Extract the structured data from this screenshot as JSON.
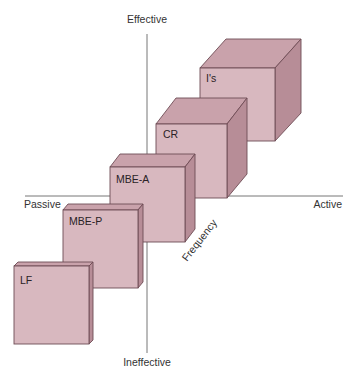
{
  "diagram": {
    "type": "full-range leadership model (3D)",
    "axes": {
      "vertical": {
        "top_label": "Effective",
        "bottom_label": "Ineffective"
      },
      "horizontal": {
        "left_label": "Passive",
        "right_label": "Active"
      },
      "depth": {
        "label": "Frequency"
      }
    },
    "boxes": [
      {
        "id": "lf",
        "label": "LF"
      },
      {
        "id": "mbe-p",
        "label": "MBE-P"
      },
      {
        "id": "mbe-a",
        "label": "MBE-A"
      },
      {
        "id": "cr",
        "label": "CR"
      },
      {
        "id": "is",
        "label": "I's"
      }
    ],
    "colors": {
      "front": "#d8b8bf",
      "top": "#c9a2ab",
      "side": "#b78d97",
      "edge": "#6e4c55",
      "axis": "#777777"
    }
  }
}
